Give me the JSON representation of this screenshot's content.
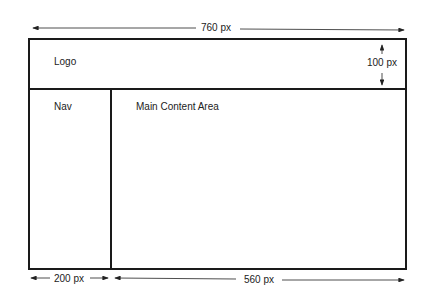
{
  "diagram": {
    "labels": {
      "logo": "Logo",
      "nav": "Nav",
      "main": "Main Content Area"
    },
    "dimensions": {
      "total_width": "760 px",
      "header_height": "100 px",
      "nav_width": "200 px",
      "main_width": "560 px"
    }
  }
}
